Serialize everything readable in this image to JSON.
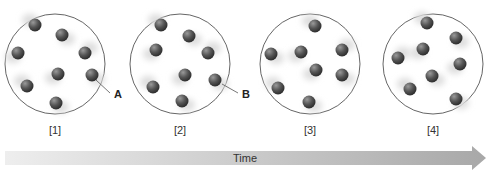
{
  "figure": {
    "panels": [
      {
        "label": "[1]",
        "cx": 55,
        "cy": 64,
        "r": 50,
        "molecules": [
          [
            35,
            25
          ],
          [
            62,
            35
          ],
          [
            18,
            53
          ],
          [
            85,
            53
          ],
          [
            58,
            74
          ],
          [
            92,
            75
          ],
          [
            27,
            86
          ],
          [
            56,
            103
          ]
        ],
        "callout": {
          "text": "A",
          "tx": 114,
          "ty": 98,
          "lx1": 96,
          "ly1": 80,
          "lx2": 110,
          "ly2": 93
        }
      },
      {
        "label": "[2]",
        "cx": 180,
        "cy": 64,
        "r": 50,
        "molecules": [
          [
            161,
            25
          ],
          [
            189,
            36
          ],
          [
            156,
            50
          ],
          [
            208,
            53
          ],
          [
            185,
            75
          ],
          [
            215,
            80
          ],
          [
            153,
            87
          ],
          [
            182,
            101
          ]
        ],
        "callout": {
          "text": "B",
          "tx": 242,
          "ty": 98,
          "lx1": 222,
          "ly1": 84,
          "lx2": 238,
          "ly2": 93
        }
      },
      {
        "label": "[3]",
        "cx": 310,
        "cy": 64,
        "r": 50,
        "molecules": [
          [
            315,
            26
          ],
          [
            271,
            54
          ],
          [
            301,
            52
          ],
          [
            342,
            50
          ],
          [
            316,
            70
          ],
          [
            342,
            75
          ],
          [
            278,
            88
          ],
          [
            309,
            102
          ]
        ],
        "callout": null
      },
      {
        "label": "[4]",
        "cx": 433,
        "cy": 64,
        "r": 50,
        "molecules": [
          [
            427,
            23
          ],
          [
            456,
            38
          ],
          [
            423,
            49
          ],
          [
            398,
            58
          ],
          [
            460,
            64
          ],
          [
            432,
            76
          ],
          [
            410,
            89
          ],
          [
            456,
            99
          ]
        ],
        "callout": null
      }
    ],
    "label_y": 134,
    "arrow": {
      "label": "Time",
      "start_color": "#eeeeee",
      "end_color": "#a8a8a8"
    },
    "colors": {
      "molecule": "#5a5a5a",
      "circle_stroke": "#666666",
      "blur": "#dcdcdc"
    }
  }
}
